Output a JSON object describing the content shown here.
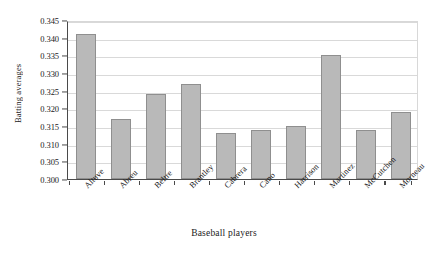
{
  "chart_data": {
    "type": "bar",
    "title": "",
    "xlabel": "Baseball players",
    "ylabel": "Batting averages",
    "categories": [
      "Altuve",
      "Abreu",
      "Beltre",
      "Brantley",
      "Cabrera",
      "Cano",
      "Harrison",
      "Martinez",
      "McCutchen",
      "Morneau"
    ],
    "values": [
      0.341,
      0.317,
      0.324,
      0.327,
      0.313,
      0.314,
      0.315,
      0.335,
      0.314,
      0.319
    ],
    "ylim": [
      0.3,
      0.345
    ],
    "ytick_values": [
      0.3,
      0.305,
      0.31,
      0.315,
      0.32,
      0.325,
      0.33,
      0.335,
      0.34,
      0.345
    ],
    "ytick_labels": [
      "0.300",
      "0.305",
      "0.310",
      "0.315",
      "0.320",
      "0.325",
      "0.330",
      "0.335",
      "0.340",
      "0.345"
    ],
    "grid": true,
    "legend": false,
    "bar_color": "#b9b9b9",
    "bar_edge_color": "#8f8f8f",
    "axis_color": "#4a4a4a",
    "grid_color": "#d9d9d9",
    "background_color": "#ffffff"
  }
}
